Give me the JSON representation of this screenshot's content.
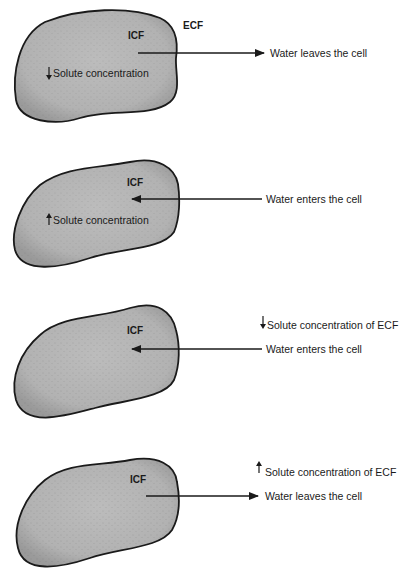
{
  "panels": [
    {
      "cell_label": "ICF",
      "outside_label": "ECF",
      "inner_text": "Solute concentration",
      "inner_arrow": "down",
      "ecf_text": "",
      "ecf_arrow": "",
      "water_text": "Water leaves the cell",
      "water_direction": "out"
    },
    {
      "cell_label": "ICF",
      "outside_label": "",
      "inner_text": "Solute concentration",
      "inner_arrow": "up",
      "ecf_text": "",
      "ecf_arrow": "",
      "water_text": "Water enters the cell",
      "water_direction": "in"
    },
    {
      "cell_label": "ICF",
      "outside_label": "",
      "inner_text": "",
      "inner_arrow": "",
      "ecf_text": "Solute concentration of ECF",
      "ecf_arrow": "down",
      "water_text": "Water enters the cell",
      "water_direction": "in"
    },
    {
      "cell_label": "ICF",
      "outside_label": "",
      "inner_text": "",
      "inner_arrow": "",
      "ecf_text": "Solute concentration of ECF",
      "ecf_arrow": "up",
      "water_text": "Water leaves the cell",
      "water_direction": "out"
    }
  ],
  "colors": {
    "cell_fill": "#b4b4b4",
    "cell_stroke": "#1a1a1a",
    "text": "#1a1a1a"
  }
}
